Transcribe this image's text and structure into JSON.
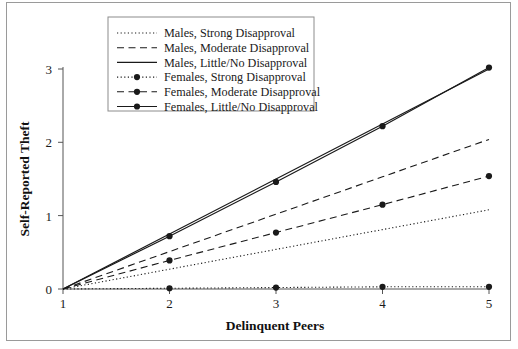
{
  "chart_data": {
    "type": "line",
    "title": "",
    "xlabel": "Delinquent Peers",
    "ylabel": "Self-Reported Theft",
    "x": [
      1,
      2,
      3,
      4,
      5
    ],
    "xtick_labels": [
      "1",
      "2",
      "3",
      "4",
      "5"
    ],
    "ytick_labels": [
      "0",
      "1",
      "2",
      "3"
    ],
    "yticks": [
      0,
      1,
      2,
      3
    ],
    "xlim": [
      1,
      5
    ],
    "ylim": [
      0,
      3.15
    ],
    "grid": false,
    "legend_position": "top-center-inside",
    "series": [
      {
        "name": "Males, Strong Disapproval",
        "style": "dotted",
        "marker": "none",
        "color": "#1a1a1a",
        "values": [
          0,
          0.27,
          0.54,
          0.81,
          1.08
        ]
      },
      {
        "name": "Males, Moderate Disapproval",
        "style": "dashed",
        "marker": "none",
        "color": "#1a1a1a",
        "values": [
          0,
          0.51,
          1.02,
          1.53,
          2.04
        ]
      },
      {
        "name": "Males, Little/No Disapproval",
        "style": "solid",
        "marker": "none",
        "color": "#1a1a1a",
        "values": [
          0,
          0.75,
          1.5,
          2.25,
          3.0
        ]
      },
      {
        "name": "Females, Strong Disapproval",
        "style": "dotted",
        "marker": "circle",
        "color": "#1a1a1a",
        "values": [
          0,
          0.01,
          0.02,
          0.03,
          0.03
        ]
      },
      {
        "name": "Females, Moderate Disapproval",
        "style": "dashed",
        "marker": "circle",
        "color": "#1a1a1a",
        "values": [
          0,
          0.39,
          0.77,
          1.15,
          1.54
        ]
      },
      {
        "name": "Females, Little/No Disapproval",
        "style": "solid",
        "marker": "circle",
        "color": "#1a1a1a",
        "values": [
          0,
          0.72,
          1.46,
          2.22,
          3.02
        ]
      }
    ]
  },
  "legend": {
    "items": [
      "Males, Strong Disapproval",
      "Males, Moderate Disapproval",
      "Males, Little/No Disapproval",
      "Females, Strong Disapproval",
      "Females, Moderate Disapproval",
      "Females, Little/No Disapproval"
    ]
  },
  "axes": {
    "x_title": "Delinquent Peers",
    "y_title": "Self-Reported Theft",
    "x_ticks": [
      "1",
      "2",
      "3",
      "4",
      "5"
    ],
    "y_ticks": [
      "0",
      "1",
      "2",
      "3"
    ]
  }
}
